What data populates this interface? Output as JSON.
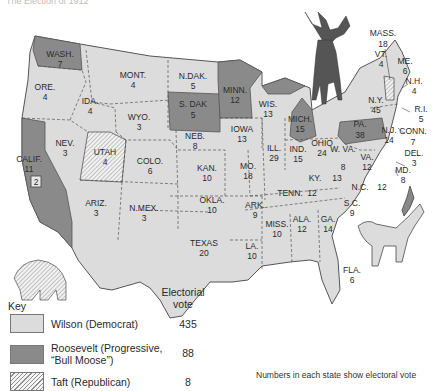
{
  "title": "The Election of 1912",
  "colors": {
    "wilson": "#dcdcdc",
    "roosevelt": "#8a8a8a",
    "taft_hatch": "#8f8f8f",
    "border": "#555555"
  },
  "states": [
    {
      "abbr": "WASH.",
      "votes": "7",
      "party": "roosevelt"
    },
    {
      "abbr": "ORE.",
      "votes": "4",
      "party": "wilson"
    },
    {
      "abbr": "CALIF.",
      "votes": "11",
      "extra": "2",
      "party": "roosevelt"
    },
    {
      "abbr": "IDA.",
      "votes": "4",
      "party": "wilson"
    },
    {
      "abbr": "NEV.",
      "votes": "3",
      "party": "wilson"
    },
    {
      "abbr": "MONT.",
      "votes": "4",
      "party": "wilson"
    },
    {
      "abbr": "WYO.",
      "votes": "3",
      "party": "wilson"
    },
    {
      "abbr": "UTAH",
      "votes": "4",
      "party": "taft"
    },
    {
      "abbr": "ARIZ.",
      "votes": "3",
      "party": "wilson"
    },
    {
      "abbr": "COLO.",
      "votes": "6",
      "party": "wilson"
    },
    {
      "abbr": "N.MEX.",
      "votes": "3",
      "party": "wilson"
    },
    {
      "abbr": "N.DAK.",
      "votes": "5",
      "party": "wilson"
    },
    {
      "abbr": "S. DAK",
      "votes": "5",
      "party": "roosevelt"
    },
    {
      "abbr": "NEB.",
      "votes": "8",
      "party": "wilson"
    },
    {
      "abbr": "KAN.",
      "votes": "10",
      "party": "wilson"
    },
    {
      "abbr": "OKLA.",
      "votes": "10",
      "party": "wilson"
    },
    {
      "abbr": "TEXAS",
      "votes": "20",
      "party": "wilson"
    },
    {
      "abbr": "MINN.",
      "votes": "12",
      "party": "roosevelt"
    },
    {
      "abbr": "IOWA",
      "votes": "13",
      "party": "wilson"
    },
    {
      "abbr": "MO.",
      "votes": "18",
      "party": "wilson"
    },
    {
      "abbr": "ARK.",
      "votes": "9",
      "party": "wilson"
    },
    {
      "abbr": "LA.",
      "votes": "10",
      "party": "wilson"
    },
    {
      "abbr": "WIS.",
      "votes": "13",
      "party": "wilson"
    },
    {
      "abbr": "ILL.",
      "votes": "29",
      "party": "wilson"
    },
    {
      "abbr": "MICH.",
      "votes": "15",
      "party": "roosevelt"
    },
    {
      "abbr": "IND.",
      "votes": "15",
      "party": "wilson"
    },
    {
      "abbr": "OHIO",
      "votes": "24",
      "party": "wilson"
    },
    {
      "abbr": "KY.",
      "votes": "13",
      "party": "wilson"
    },
    {
      "abbr": "TENN.",
      "votes": "12",
      "party": "wilson"
    },
    {
      "abbr": "MISS.",
      "votes": "10",
      "party": "wilson"
    },
    {
      "abbr": "ALA.",
      "votes": "12",
      "party": "wilson"
    },
    {
      "abbr": "GA.",
      "votes": "14",
      "party": "wilson"
    },
    {
      "abbr": "FLA.",
      "votes": "6",
      "party": "wilson"
    },
    {
      "abbr": "S.C.",
      "votes": "9",
      "party": "wilson"
    },
    {
      "abbr": "N.C.",
      "votes": "12",
      "party": "wilson"
    },
    {
      "abbr": "VA.",
      "votes": "12",
      "party": "wilson"
    },
    {
      "abbr": "W. VA.",
      "votes": "8",
      "party": "wilson"
    },
    {
      "abbr": "PA.",
      "votes": "38",
      "party": "roosevelt"
    },
    {
      "abbr": "N.Y.",
      "votes": "45",
      "party": "wilson"
    },
    {
      "abbr": "N.J.",
      "votes": "14",
      "party": "wilson"
    },
    {
      "abbr": "DEL.",
      "votes": "3",
      "party": "wilson"
    },
    {
      "abbr": "MD.",
      "votes": "8",
      "party": "wilson"
    },
    {
      "abbr": "CONN.",
      "votes": "7",
      "party": "wilson"
    },
    {
      "abbr": "R.I.",
      "votes": "5",
      "party": "wilson"
    },
    {
      "abbr": "MASS.",
      "votes": "18",
      "party": "wilson"
    },
    {
      "abbr": "VT.",
      "votes": "4",
      "party": "taft"
    },
    {
      "abbr": "N.H.",
      "votes": "4",
      "party": "wilson"
    },
    {
      "abbr": "ME.",
      "votes": "6",
      "party": "wilson"
    }
  ],
  "illustrations": [
    "moose-icon",
    "elephant-icon",
    "donkey-icon"
  ],
  "key": {
    "title": "Key",
    "ev_header_line1": "Electorial",
    "ev_header_line2": "vote",
    "rows": [
      {
        "label": "Wilson (Democrat)",
        "votes": "435"
      },
      {
        "label": "Roosevelt (Progressive, “Bull Moose”)",
        "votes": "88"
      },
      {
        "label": "Taft (Republican)",
        "votes": "8"
      }
    ]
  },
  "footnote": "Numbers in each state show electoral vote"
}
